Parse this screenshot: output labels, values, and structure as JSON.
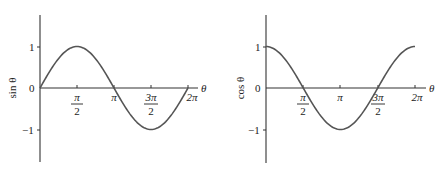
{
  "chart_data": [
    {
      "type": "line",
      "title": "",
      "xlabel": "θ",
      "ylabel": "sin θ",
      "function": "sin",
      "xlim": [
        0,
        6.2832
      ],
      "ylim": [
        -1.8,
        1.8
      ],
      "grid": false,
      "x_ticks": [
        {
          "value": 1.5708,
          "label_num": "π",
          "label_den": "2",
          "fraction": true
        },
        {
          "value": 3.1416,
          "label": "π",
          "fraction": false
        },
        {
          "value": 4.7124,
          "label_num": "3π",
          "label_den": "2",
          "fraction": true
        },
        {
          "value": 6.2832,
          "label": "2π",
          "fraction": false
        }
      ],
      "y_ticks": [
        {
          "value": 1,
          "label": "1"
        },
        {
          "value": 0,
          "label": "0"
        },
        {
          "value": -1,
          "label": "−1"
        }
      ],
      "x": [
        0,
        0.7854,
        1.5708,
        2.3562,
        3.1416,
        3.927,
        4.7124,
        5.4978,
        6.2832
      ],
      "values": [
        0,
        0.707,
        1,
        0.707,
        0,
        -0.707,
        -1,
        -0.707,
        0
      ]
    },
    {
      "type": "line",
      "title": "",
      "xlabel": "θ",
      "ylabel": "cos θ",
      "function": "cos",
      "xlim": [
        0,
        6.2832
      ],
      "ylim": [
        -1.8,
        1.8
      ],
      "grid": false,
      "x_ticks": [
        {
          "value": 1.5708,
          "label_num": "π",
          "label_den": "2",
          "fraction": true
        },
        {
          "value": 3.1416,
          "label": "π",
          "fraction": false
        },
        {
          "value": 4.7124,
          "label_num": "3π",
          "label_den": "2",
          "fraction": true
        },
        {
          "value": 6.2832,
          "label": "2π",
          "fraction": false
        }
      ],
      "y_ticks": [
        {
          "value": 1,
          "label": "1"
        },
        {
          "value": 0,
          "label": "0"
        },
        {
          "value": -1,
          "label": "−1"
        }
      ],
      "x": [
        0,
        0.7854,
        1.5708,
        2.3562,
        3.1416,
        3.927,
        4.7124,
        5.4978,
        6.2832
      ],
      "values": [
        1,
        0.707,
        0,
        -0.707,
        -1,
        -0.707,
        0,
        0.707,
        1
      ]
    }
  ],
  "charts": {
    "sin": {
      "ylabel": "sin θ",
      "xlabel": "θ",
      "y1": "1",
      "y0": "0",
      "ym1": "−1",
      "t1_num": "π",
      "t1_den": "2",
      "t2": "π",
      "t3_num": "3π",
      "t3_den": "2",
      "t4": "2π"
    },
    "cos": {
      "ylabel": "cos θ",
      "xlabel": "θ",
      "y1": "1",
      "y0": "0",
      "ym1": "−1",
      "t1_num": "π",
      "t1_den": "2",
      "t2": "π",
      "t3_num": "3π",
      "t3_den": "2",
      "t4": "2π"
    }
  },
  "colors": {
    "axis": "#333333",
    "curve": "#555555",
    "text": "#222222",
    "background": "#ffffff"
  }
}
